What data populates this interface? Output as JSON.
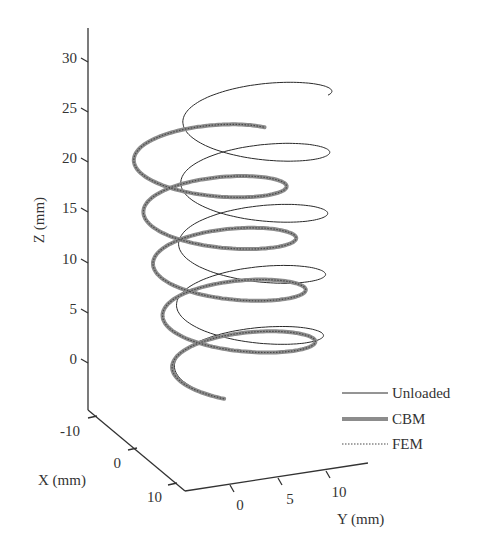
{
  "chart_data": {
    "type": "line3d",
    "title": "",
    "axes": {
      "x": {
        "label": "X (mm)",
        "ticks": [
          "-10",
          "0",
          "10"
        ],
        "range": [
          -15,
          15
        ]
      },
      "y": {
        "label": "Y (mm)",
        "ticks": [
          "0",
          "5",
          "10"
        ],
        "range": [
          -5,
          15
        ]
      },
      "z": {
        "label": "Z (mm)",
        "ticks": [
          "0",
          "5",
          "10",
          "15",
          "20",
          "25",
          "30"
        ],
        "range": [
          -5,
          32
        ]
      }
    },
    "grid": false,
    "legend": {
      "position": "lower right",
      "entries": [
        {
          "name": "Unloaded",
          "style": "thin solid",
          "color": "#333333"
        },
        {
          "name": "CBM",
          "style": "thick solid",
          "color": "#8a8a8a"
        },
        {
          "name": "FEM",
          "style": "dotted",
          "color": "#555555"
        }
      ]
    },
    "series": [
      {
        "name": "Unloaded",
        "shape": "helix",
        "radius_mm": 10,
        "turns": 4.75,
        "z_start_mm": -3,
        "z_end_mm": 25
      },
      {
        "name": "CBM",
        "shape": "helix (deformed, tilted)",
        "radius_mm": 10,
        "turns": 4.6,
        "z_start_mm": -3,
        "z_end_mm": 20
      },
      {
        "name": "FEM",
        "shape": "helix (deformed, tilted)",
        "radius_mm": 10,
        "turns": 4.6,
        "z_start_mm": -3,
        "z_end_mm": 20
      }
    ]
  },
  "legend_labels": {
    "unloaded": "Unloaded",
    "cbm": "CBM",
    "fem": "FEM"
  },
  "axis_labels": {
    "x": "X (mm)",
    "y": "Y (mm)",
    "z": "Z (mm)"
  },
  "z_ticks": [
    "30",
    "25",
    "20",
    "15",
    "10",
    "5",
    "0"
  ],
  "x_ticks": [
    "-10",
    "0",
    "10"
  ],
  "y_ticks": [
    "0",
    "5",
    "10"
  ]
}
